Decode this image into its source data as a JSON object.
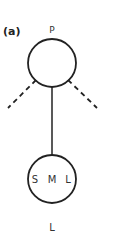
{
  "panel_label": "(a)",
  "top_node": {
    "label": "P"
  },
  "bottom_node": {
    "label": "L",
    "inner_labels": [
      "S",
      "M",
      "L"
    ]
  },
  "colors": {
    "stroke": "#222222",
    "text": "#333333",
    "background": "#ffffff"
  }
}
